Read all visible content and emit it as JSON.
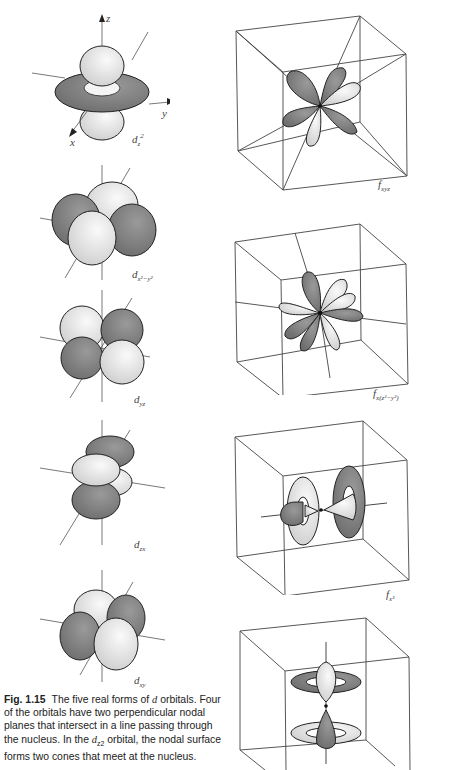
{
  "figure": {
    "number": "Fig. 1.15",
    "caption_parts": {
      "a": "The five real forms of ",
      "b": "d",
      "c": " orbitals. Four of the orbitals have two perpendicular nodal planes that intersect in a line passing through the nucleus. In the ",
      "d": "d",
      "e": "z2",
      "f": " orbital, the nodal surface forms two cones that meet at the nucleus."
    }
  },
  "axes": {
    "z": "z",
    "y": "y",
    "x": "x"
  },
  "d_orbitals": [
    {
      "id": "dz2",
      "label_main": "d",
      "label_sub": "z",
      "label_sup": "2"
    },
    {
      "id": "dx2-y2",
      "label_main": "d",
      "label_sub": "x²−y²"
    },
    {
      "id": "dyz",
      "label_main": "d",
      "label_sub": "yz"
    },
    {
      "id": "dzx",
      "label_main": "d",
      "label_sub": "zx"
    },
    {
      "id": "dxy",
      "label_main": "d",
      "label_sub": "xy"
    }
  ],
  "f_orbitals": [
    {
      "id": "fxyz",
      "label_main": "f",
      "label_sub": "xyz"
    },
    {
      "id": "fx(z2-y2)",
      "label_main": "f",
      "label_sub": "x(z²−y²)"
    },
    {
      "id": "fx3",
      "label_main": "f",
      "label_sub": "x³"
    },
    {
      "id": "fz3",
      "label_main": "",
      "label_sub": ""
    }
  ],
  "colors": {
    "dark_lobe": "#7a7a7a",
    "light_lobe": "#dcdcdc",
    "outline": "#222222",
    "axis": "#555555"
  }
}
